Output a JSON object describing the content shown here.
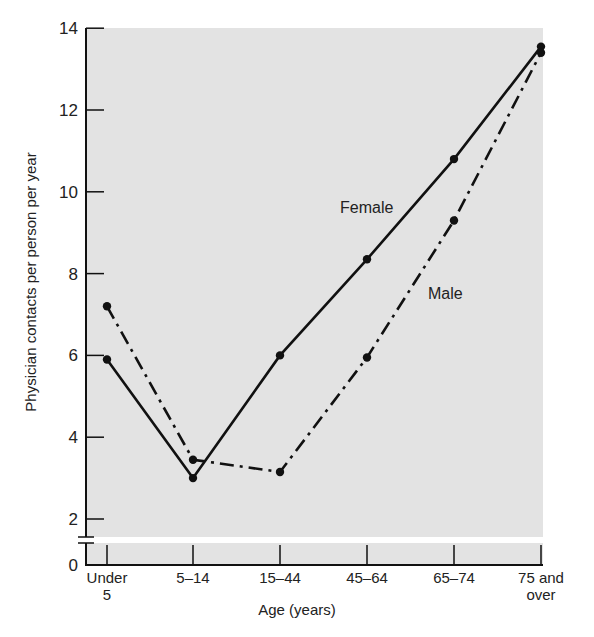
{
  "chart_data": {
    "type": "line",
    "title": "",
    "xlabel": "Age (years)",
    "ylabel": "Physician contacts per person per year",
    "categories": [
      "Under 5",
      "5–14",
      "15–44",
      "45–64",
      "65–74",
      "75 and over"
    ],
    "category_lines": [
      [
        "Under",
        "5"
      ],
      [
        "5–14"
      ],
      [
        "15–44"
      ],
      [
        "45–64"
      ],
      [
        "65–74"
      ],
      [
        "75 and",
        "over"
      ]
    ],
    "series": [
      {
        "name": "Female",
        "style": "solid",
        "values": [
          5.9,
          3.0,
          6.0,
          8.35,
          10.8,
          13.55
        ]
      },
      {
        "name": "Male",
        "style": "dash-dot",
        "values": [
          7.2,
          3.45,
          3.15,
          5.95,
          9.3,
          13.4
        ]
      }
    ],
    "yticks": [
      0,
      2,
      4,
      6,
      8,
      10,
      12,
      14
    ],
    "ylim": [
      0,
      14
    ],
    "axis_break": "between 0 and 2",
    "grid": false,
    "legend": "inline labels",
    "background": "#e3e3e3"
  },
  "labels": {
    "ylabel": "Physician contacts per person per year",
    "xlabel": "Age (years)",
    "female": "Female",
    "male": "Male"
  }
}
